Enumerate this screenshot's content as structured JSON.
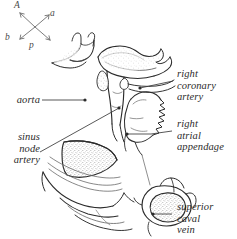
{
  "figure": {
    "background_color": "#ffffff",
    "ink_color": "#2b2b2b",
    "stipple_color": "#6b6b6b",
    "leader_color": "#3a3a3a"
  },
  "compass": {
    "name": "orientation-compass",
    "labels": {
      "superior": "A",
      "anterior": "a",
      "posterior_left": "b",
      "inferior": "p"
    }
  },
  "labels": {
    "aorta": {
      "text": "aorta",
      "side": "left"
    },
    "sinus_node_artery": {
      "line1": "sinus",
      "line2": "node",
      "line3": "artery",
      "side": "left"
    },
    "right_coronary_artery": {
      "line1": "right",
      "line2": "coronary",
      "line3": "artery",
      "side": "right"
    },
    "right_atrial_appendage": {
      "line1": "right",
      "line2": "atrial",
      "line3": "appendage",
      "side": "right"
    },
    "superior_caval_vein": {
      "line1": "superior",
      "line2": "caval",
      "line3": "vein",
      "side": "right"
    }
  }
}
